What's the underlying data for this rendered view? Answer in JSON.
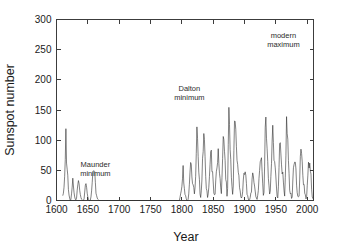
{
  "chart_data": {
    "type": "line",
    "title": "",
    "xlabel": "Year",
    "ylabel": "Sunspot number",
    "xlim": [
      1600,
      2010
    ],
    "ylim": [
      0,
      300
    ],
    "xticks": [
      1600,
      1650,
      1700,
      1750,
      1800,
      1850,
      1900,
      1950,
      2000
    ],
    "yticks": [
      0,
      50,
      100,
      150,
      200,
      250,
      300
    ],
    "grid": false,
    "legend": "none",
    "line_color": "#2e2e2e",
    "axis_color": "#3c3c3c",
    "background_color": "#ffffff",
    "annotations": [
      {
        "label": "Maunder\nminimum",
        "line1": "Maunder",
        "line2": "minimum",
        "x": 1662,
        "y": 55
      },
      {
        "label": "Dalton\nminimum",
        "line1": "Dalton",
        "line2": "minimum",
        "x": 1812,
        "y": 182
      },
      {
        "label": "modern\nmaximum",
        "line1": "modern",
        "line2": "maximum",
        "x": 1962,
        "y": 270
      }
    ],
    "x_start": 1610,
    "x_step": 1,
    "series": [
      {
        "name": "Annual mean sunspot number",
        "values": [
          8,
          12,
          22,
          40,
          68,
          119,
          62,
          52,
          42,
          18,
          9,
          4,
          0,
          2,
          11,
          22,
          37,
          24,
          13,
          6,
          2,
          1,
          4,
          17,
          26,
          33,
          28,
          17,
          10,
          5,
          2,
          1,
          0,
          0,
          3,
          14,
          25,
          28,
          22,
          12,
          6,
          2,
          0,
          0,
          1,
          6,
          16,
          30,
          48,
          49,
          49,
          48,
          30,
          12,
          8,
          4,
          2,
          1,
          0,
          0,
          0,
          0,
          0,
          0,
          0,
          0,
          0,
          0,
          0,
          0,
          0,
          0,
          0,
          0,
          0,
          0,
          0,
          0,
          0,
          0,
          0,
          0,
          0,
          0,
          0,
          0,
          0,
          0,
          0,
          0,
          0,
          0,
          0,
          0,
          0,
          0,
          0,
          0,
          0,
          0,
          0,
          0,
          0,
          0,
          0,
          0,
          0,
          0,
          0,
          0,
          0,
          0,
          0,
          0,
          0,
          0,
          0,
          0,
          0,
          0,
          0,
          0,
          0,
          0,
          0,
          0,
          0,
          0,
          0,
          0,
          0,
          0,
          0,
          0,
          0,
          0,
          0,
          0,
          0,
          0,
          0,
          0,
          0,
          0,
          0,
          0,
          0,
          0,
          0,
          0,
          0,
          0,
          0,
          0,
          0,
          0,
          0,
          0,
          0,
          0,
          0,
          0,
          0,
          0,
          0,
          0,
          0,
          0,
          0,
          0,
          0,
          0,
          0,
          0,
          0,
          0,
          0,
          0,
          0,
          0,
          0,
          0,
          0,
          0,
          0,
          0,
          0,
          5,
          11,
          16,
          23,
          36,
          58,
          29,
          20,
          10,
          8,
          3,
          0,
          0,
          2,
          11,
          27,
          47,
          63,
          60,
          39,
          28,
          26,
          22,
          11,
          21,
          40,
          78,
          122,
          103,
          73,
          47,
          35,
          11,
          5,
          16,
          34,
          70,
          81,
          111,
          101,
          73,
          40,
          20,
          16,
          5,
          11,
          22,
          40,
          60,
          80.9,
          83.4,
          47.7,
          47.8,
          30.7,
          12.2,
          9.6,
          10.2,
          32.4,
          47.6,
          54,
          62.9,
          85.9,
          61.2,
          45.1,
          36.4,
          20.9,
          11.4,
          37.8,
          69.8,
          106.1,
          100.8,
          81.6,
          66.5,
          34.8,
          30.6,
          7,
          19.8,
          92.5,
          154.4,
          125.9,
          84.8,
          68.1,
          38.5,
          22.8,
          10.2,
          24.1,
          82.9,
          132,
          130.9,
          118.1,
          89.9,
          66.6,
          60,
          46.9,
          41,
          21.3,
          16,
          6.4,
          4.1,
          6.8,
          14.5,
          34,
          45,
          43.1,
          47.5,
          42.2,
          28.1,
          10.1,
          8.1,
          2.5,
          0,
          1.4,
          5,
          12.2,
          13.9,
          35.4,
          45.8,
          41.1,
          30.1,
          23.9,
          15.6,
          6.6,
          4,
          1.8,
          8.5,
          16.6,
          36.3,
          49.6,
          64.2,
          67,
          70.9,
          47.8,
          27.5,
          8.5,
          13.2,
          56.9,
          121.5,
          138.3,
          103.2,
          85.7,
          64.6,
          36.7,
          24.2,
          10.7,
          15,
          40.1,
          61.5,
          98.5,
          124.7,
          96.3,
          66.6,
          64.5,
          54.1,
          39,
          20.6,
          6.7,
          4.3,
          22.7,
          54.8,
          93.8,
          95.8,
          77.2,
          59.1,
          44,
          47,
          30.5,
          16.3,
          7.3,
          37.6,
          74,
          139,
          111.2,
          101.6,
          66.2,
          44.7,
          17,
          11.3,
          12.4,
          3.4,
          6,
          32.3,
          54.3,
          59.7,
          63.7,
          63.5,
          52.2,
          25.4,
          13.1,
          6.8,
          6.3,
          7.1,
          35.6,
          73,
          85.1,
          78,
          64,
          41.8,
          26.2,
          26.7,
          12.1,
          9.5,
          2.7,
          5,
          24.4,
          42,
          63.5,
          53.8,
          62,
          48.5,
          43.9,
          18.6,
          5.7,
          3.6,
          1.4,
          9.6,
          47.4,
          57.1,
          103.9,
          80.6,
          63.6,
          37.6,
          26.1,
          14.2,
          5.8,
          16.7,
          44.3,
          63.9,
          69,
          77.8,
          64.9,
          35.7,
          21.2,
          11.1,
          5.7,
          8.7,
          36.1,
          79.7,
          114.4,
          109.6,
          88.8,
          67.8,
          47.5,
          30.6,
          16.3,
          9.6,
          33.2,
          92.6,
          151.6,
          136.3,
          134.7,
          83.9,
          69.4,
          31.5,
          13.9,
          4.4,
          38,
          141.7,
          190.2,
          184.8,
          159,
          112.3,
          53.9,
          37.5,
          27.9,
          10.2,
          15.1,
          47,
          93.8,
          105.9,
          105.5,
          104.5,
          66.6,
          68.9,
          38,
          34.5,
          15.5,
          12.6,
          27.5,
          92.5,
          155.4,
          154.6,
          140.4,
          115.9,
          66.6,
          45.9,
          17.9,
          13.4,
          29.4,
          100.2,
          157.6,
          142.6,
          145.7,
          94.3,
          54.6,
          29.9,
          17.5,
          8.6,
          21.5,
          64.3,
          93.3,
          119.6,
          111,
          104,
          63.7,
          40.4,
          29.8,
          15.2,
          7.5,
          2.9,
          3.1,
          16.5,
          40.3
        ]
      }
    ]
  },
  "axis": {
    "y_title": "Sunspot number",
    "x_title": "Year"
  }
}
